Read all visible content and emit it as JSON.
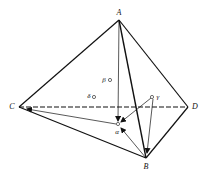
{
  "figure": {
    "type": "tetrahedron-vector-diagram",
    "vertices": {
      "A": {
        "label": "A",
        "x": 119,
        "y": 20
      },
      "B": {
        "label": "B",
        "x": 146,
        "y": 158
      },
      "C": {
        "label": "C",
        "x": 19,
        "y": 107
      },
      "D": {
        "label": "D",
        "x": 188,
        "y": 107
      }
    },
    "points": {
      "alpha": {
        "label": "α",
        "x": 118,
        "y": 124
      },
      "beta": {
        "label": "β",
        "x": 110,
        "y": 80
      },
      "gamma": {
        "label": "γ",
        "x": 152,
        "y": 97
      },
      "delta": {
        "label": "δ",
        "x": 94,
        "y": 97
      }
    },
    "edges": [
      {
        "from": "A",
        "to": "C",
        "style": "solid"
      },
      {
        "from": "A",
        "to": "D",
        "style": "solid"
      },
      {
        "from": "A",
        "to": "B",
        "style": "solid"
      },
      {
        "from": "C",
        "to": "B",
        "style": "solid"
      },
      {
        "from": "B",
        "to": "D",
        "style": "solid"
      },
      {
        "from": "C",
        "to": "D",
        "style": "dashed"
      }
    ],
    "arrows": [
      {
        "from": "A",
        "to": "alpha"
      },
      {
        "from": "B",
        "to": "alpha"
      },
      {
        "from": "gamma",
        "to": "alpha"
      },
      {
        "from": "gamma",
        "to": "B"
      },
      {
        "from": "alpha",
        "to": "C"
      }
    ]
  },
  "labels": {
    "A": "A",
    "B": "B",
    "C": "C",
    "D": "D",
    "alpha": "α",
    "beta": "β",
    "gamma": "γ",
    "delta": "δ"
  }
}
